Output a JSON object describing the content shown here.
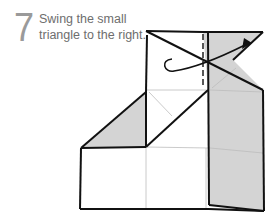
{
  "step": {
    "number": "7",
    "instruction_line1": "Swing the small",
    "instruction_line2": "triangle to the right."
  },
  "diagram": {
    "colors": {
      "outline": "#111111",
      "shade": "#d4d4d4",
      "crease": "#bdbdbd",
      "background": "#ffffff"
    },
    "arrow": "swing-right-arrow",
    "fold_line": "dashed-vertical-line"
  }
}
